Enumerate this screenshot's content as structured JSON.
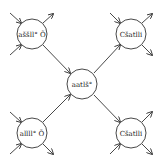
{
  "diagram": {
    "stroke_color": "#333333",
    "background": "#ffffff",
    "nodes": [
      {
        "id": "top-left",
        "label": "aššll° Õ",
        "cx": 32,
        "cy": 34,
        "r": 15
      },
      {
        "id": "top-right",
        "label": "Cšatlli",
        "cx": 131,
        "cy": 34,
        "r": 15
      },
      {
        "id": "center",
        "label": "aatlš°",
        "cx": 82,
        "cy": 84,
        "r": 15
      },
      {
        "id": "bottom-left",
        "label": "allll° Õ",
        "cx": 32,
        "cy": 133,
        "r": 15
      },
      {
        "id": "bottom-right",
        "label": "Cšatlli",
        "cx": 131,
        "cy": 133,
        "r": 15
      }
    ],
    "edges": [
      {
        "from": "top-left",
        "to": "center"
      },
      {
        "from": "top-right",
        "to": "center"
      },
      {
        "from": "bottom-left",
        "to": "center"
      },
      {
        "from": "bottom-right",
        "to": "center"
      }
    ]
  }
}
